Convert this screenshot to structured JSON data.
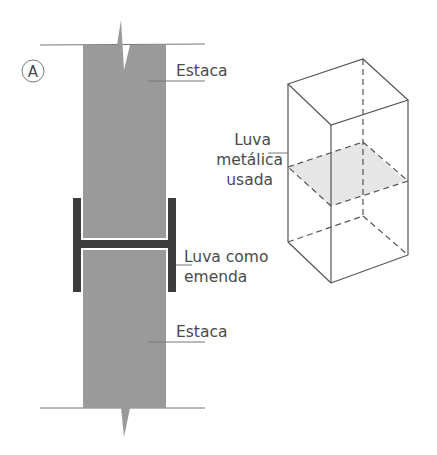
{
  "figure": {
    "panel_label": "A",
    "labels": {
      "pile_top": "Estaca",
      "pile_bottom": "Estaca",
      "splice_line1": "Luva como",
      "splice_line2": "emenda",
      "sleeve_line1": "Luva",
      "sleeve_line2": "metálica",
      "sleeve_line3": "usada"
    },
    "colors": {
      "pile_fill": "#9a9a9a",
      "profile_fill": "#3c3c3c",
      "sleeve_plane": "#e6e6e6",
      "line": "#555555",
      "text": "#4a4a4a"
    }
  }
}
